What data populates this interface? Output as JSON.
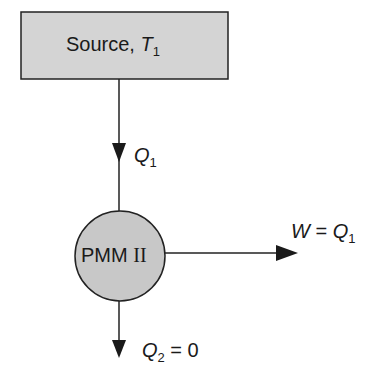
{
  "diagram": {
    "source": {
      "label": "Source, ",
      "var": "T",
      "sub": "1",
      "fill": "#d4d4d4"
    },
    "q1": {
      "var": "Q",
      "sub": "1"
    },
    "engine": {
      "label": "PMM",
      "roman": "II",
      "fill": "#c8c8c8"
    },
    "work": {
      "var": "W",
      "eq": " = ",
      "var2": "Q",
      "sub": "1"
    },
    "q2": {
      "var": "Q",
      "sub": "2",
      "eq": " = 0"
    }
  }
}
